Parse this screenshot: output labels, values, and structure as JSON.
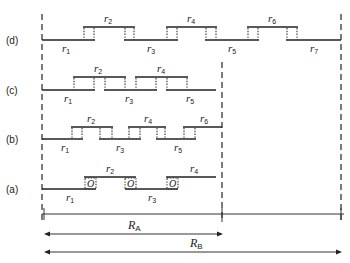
{
  "diagram": {
    "rows": [
      {
        "label": "(d)",
        "segments": [
          {
            "name": "r",
            "sub": "1",
            "level": "low"
          },
          {
            "name": "r",
            "sub": "2",
            "level": "high"
          },
          {
            "name": "r",
            "sub": "3",
            "level": "low"
          },
          {
            "name": "r",
            "sub": "4",
            "level": "high"
          },
          {
            "name": "r",
            "sub": "5",
            "level": "low"
          },
          {
            "name": "r",
            "sub": "6",
            "level": "high"
          },
          {
            "name": "r",
            "sub": "7",
            "level": "low"
          }
        ]
      },
      {
        "label": "(c)",
        "segments": [
          {
            "name": "r",
            "sub": "1",
            "level": "low"
          },
          {
            "name": "r",
            "sub": "2",
            "level": "high"
          },
          {
            "name": "r",
            "sub": "3",
            "level": "low"
          },
          {
            "name": "r",
            "sub": "4",
            "level": "high"
          },
          {
            "name": "r",
            "sub": "5",
            "level": "low"
          }
        ]
      },
      {
        "label": "(b)",
        "segments": [
          {
            "name": "r",
            "sub": "1",
            "level": "low"
          },
          {
            "name": "r",
            "sub": "2",
            "level": "high"
          },
          {
            "name": "r",
            "sub": "3",
            "level": "low"
          },
          {
            "name": "r",
            "sub": "4",
            "level": "high"
          },
          {
            "name": "r",
            "sub": "5",
            "level": "low"
          },
          {
            "name": "r",
            "sub": "6",
            "level": "high"
          }
        ]
      },
      {
        "label": "(a)",
        "overlap_marker": "O",
        "segments": [
          {
            "name": "r",
            "sub": "1",
            "level": "low"
          },
          {
            "name": "r",
            "sub": "2",
            "level": "high"
          },
          {
            "name": "r",
            "sub": "3",
            "level": "low"
          },
          {
            "name": "r",
            "sub": "4",
            "level": "high"
          }
        ]
      }
    ],
    "ranges": [
      {
        "name": "R",
        "sub": "A"
      },
      {
        "name": "R",
        "sub": "B"
      }
    ]
  }
}
